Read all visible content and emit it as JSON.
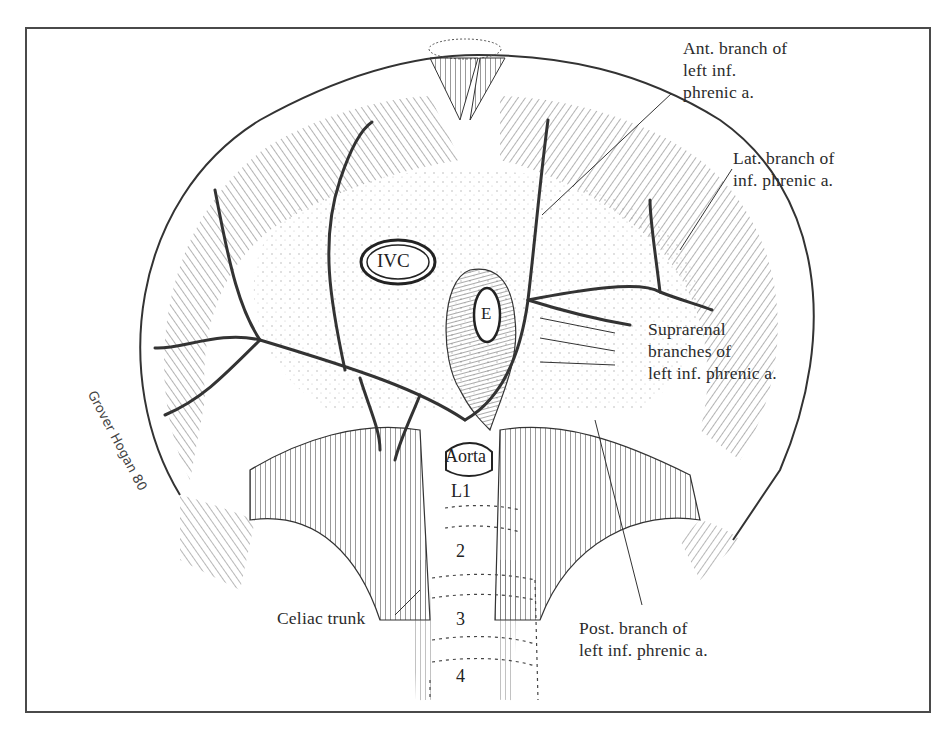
{
  "figure": {
    "colors": {
      "ink": "#2b2b2b",
      "paper": "#ffffff",
      "frame": "#4a4a4a",
      "hatch": "#6a6a6a"
    }
  },
  "labels": {
    "ant_branch": "Ant. branch of\nleft inf.\nphrenic a.",
    "lat_branch": "Lat. branch of\ninf. phrenic a.",
    "suprarenal": "Suprarenal\nbranches of\nleft inf. phrenic a.",
    "post_branch": "Post. branch of\nleft inf. phrenic a.",
    "celiac": "Celiac trunk"
  },
  "structures": {
    "ivc": "IVC",
    "esophagus": "E",
    "aorta": "Aorta",
    "vertebrae": [
      "L1",
      "2",
      "3",
      "4"
    ]
  },
  "signature": "Grover Hogan 80"
}
